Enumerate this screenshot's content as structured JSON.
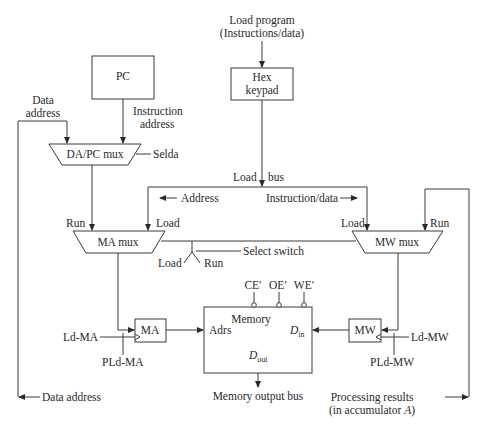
{
  "diagram": {
    "blocks": {
      "pc": "PC",
      "hex_keypad_line1": "Hex",
      "hex_keypad_line2": "keypad",
      "da_pc_mux": "DA/PC mux",
      "ma_mux": "MA mux",
      "mw_mux": "MW mux",
      "ma_register": "MA",
      "mw_register": "MW",
      "memory": "Memory"
    },
    "memory_ports": {
      "address": "Adrs",
      "data_in_main": "D",
      "data_in_sub": "in",
      "data_out_main": "D",
      "data_out_sub": "out",
      "control_ce": "CE′",
      "control_oe": "OE′",
      "control_we": "WE′"
    },
    "labels": {
      "load_program_line1": "Load program",
      "load_program_line2": "(Instructions/data)",
      "instruction_address_line1": "Instruction",
      "instruction_address_line2": "address",
      "data_address_top_line1": "Data",
      "data_address_top_line2": "address",
      "selda": "Selda",
      "load_bus_load": "Load",
      "load_bus_bus": "bus",
      "address": "Address",
      "instruction_data": "Instruction/data",
      "ma_mux_run": "Run",
      "ma_mux_load": "Load",
      "mw_mux_load": "Load",
      "mw_mux_run": "Run",
      "switch_load": "Load",
      "switch_run": "Run",
      "select_switch": "Select switch",
      "ld_ma": "Ld-MA",
      "pld_ma": "PLd-MA",
      "ld_mw": "Ld-MW",
      "pld_mw": "PLd-MW",
      "memory_output_bus": "Memory output bus",
      "data_address_bottom": "Data address",
      "processing_results_line1": "Processing results",
      "processing_results_line2_pre": "(in accumulator ",
      "processing_results_line2_var": "A",
      "processing_results_line2_post": ")"
    }
  }
}
